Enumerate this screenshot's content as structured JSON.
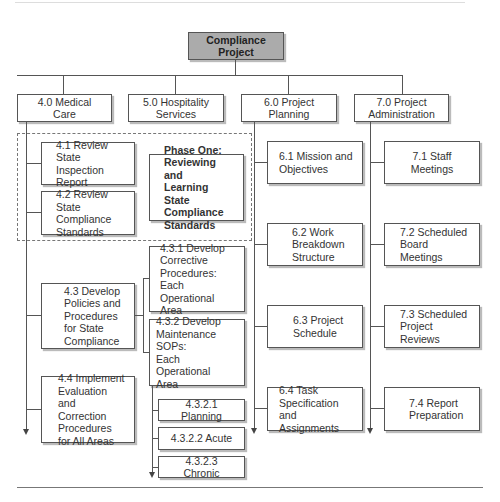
{
  "diagram": {
    "root": {
      "label": "Compliance Project"
    },
    "level1": [
      {
        "id": "4.0",
        "label": "4.0 Medical Care"
      },
      {
        "id": "5.0",
        "label": "5.0 Hospitality\nServices"
      },
      {
        "id": "6.0",
        "label": "6.0 Project Planning"
      },
      {
        "id": "7.0",
        "label": "7.0 Project\nAdministration"
      }
    ],
    "phase": {
      "label": "Phase One:\nReviewing and\nLearning State\nCompliance\nStandards"
    },
    "medical": [
      {
        "id": "4.1",
        "label": "4.1 Review State\nInspection Report"
      },
      {
        "id": "4.2",
        "label": "4.2 Review State\nCompliance\nStandards"
      },
      {
        "id": "4.3",
        "label": "4.3 Develop\nPolicies and\nProcedures\nfor State\nCompliance"
      },
      {
        "id": "4.4",
        "label": "4.4 Implement\nEvaluation and\nCorrection\nProcedures\nfor All Areas"
      }
    ],
    "sub43": [
      {
        "id": "4.3.1",
        "label": "4.3.1 Develop\nCorrective\nProcedures: Each\nOperational Area"
      },
      {
        "id": "4.3.2",
        "label": "4.3.2 Develop\nMaintenance SOPs:\nEach Operational\nArea"
      }
    ],
    "sub432": [
      {
        "id": "4.3.2.1",
        "label": "4.3.2.1 Planning"
      },
      {
        "id": "4.3.2.2",
        "label": "4.3.2.2 Acute"
      },
      {
        "id": "4.3.2.3",
        "label": "4.3.2.3 Chronic"
      }
    ],
    "planning": [
      {
        "id": "6.1",
        "label": "6.1 Mission and\nObjectives"
      },
      {
        "id": "6.2",
        "label": "6.2 Work\nBreakdown\nStructure"
      },
      {
        "id": "6.3",
        "label": "6.3 Project\nSchedule"
      },
      {
        "id": "6.4",
        "label": "6.4 Task\nSpecification and\nAssignments"
      }
    ],
    "administration": [
      {
        "id": "7.1",
        "label": "7.1 Staff Meetings"
      },
      {
        "id": "7.2",
        "label": "7.2 Scheduled\nBoard Meetings"
      },
      {
        "id": "7.3",
        "label": "7.3 Scheduled\nProject Reviews"
      },
      {
        "id": "7.4",
        "label": "7.4 Report\nPreparation"
      }
    ]
  }
}
